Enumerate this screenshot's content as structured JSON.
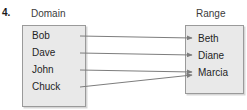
{
  "problem": {
    "number": "4."
  },
  "headings": {
    "domain": "Domain",
    "range": "Range"
  },
  "domain": {
    "members": [
      {
        "label": "Bob"
      },
      {
        "label": "Dave"
      },
      {
        "label": "John"
      },
      {
        "label": "Chuck"
      }
    ]
  },
  "range": {
    "members": [
      {
        "label": "Beth"
      },
      {
        "label": "Diane"
      },
      {
        "label": "Marcia"
      }
    ]
  },
  "mappings": [
    {
      "from": "Bob",
      "to": "Beth",
      "x1": 80,
      "y1": 36,
      "x2": 192,
      "y2": 38
    },
    {
      "from": "Dave",
      "to": "Diane",
      "x1": 80,
      "y1": 53,
      "x2": 192,
      "y2": 55
    },
    {
      "from": "John",
      "to": "Marcia",
      "x1": 80,
      "y1": 70,
      "x2": 192,
      "y2": 72
    },
    {
      "from": "Chuck",
      "to": "Marcia",
      "x1": 80,
      "y1": 87,
      "x2": 192,
      "y2": 75
    }
  ],
  "colors": {
    "box_fill": "#e9e9e9",
    "box_border": "#9a9a9a",
    "arrow": "#7d7d7d",
    "text": "#1f1f1f",
    "heading_text": "#3b3b3b",
    "background": "#ffffff"
  }
}
